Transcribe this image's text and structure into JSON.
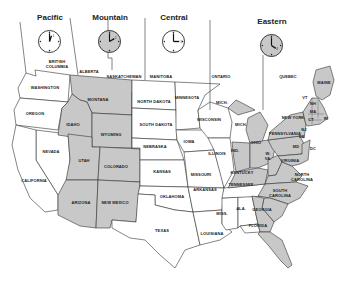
{
  "zones": [
    {
      "id": "pacific",
      "label": "Pacific",
      "hour_numeral": "1",
      "shaded": false
    },
    {
      "id": "mountain",
      "label": "Mountain",
      "hour_numeral": "2",
      "shaded": true
    },
    {
      "id": "central",
      "label": "Central",
      "hour_numeral": "3",
      "shaded": false
    },
    {
      "id": "eastern",
      "label": "Eastern",
      "hour_numeral": "4",
      "shaded": true
    }
  ],
  "colors": {
    "shaded": "#c8c8c8",
    "unshaded": "#ffffff",
    "border": "#333333",
    "text": "#222222"
  },
  "regions": {
    "canada": [
      "BRITISH COLUMBIA",
      "ALBERTA",
      "SASKATCHEWAN",
      "MANITOBA",
      "ONTARIO",
      "QUEBEC"
    ],
    "pacific": [
      "WASHINGTON",
      "OREGON",
      "NEVADA",
      "CALIFORNIA"
    ],
    "mountain": [
      "MONTANA",
      "IDAHO",
      "WYOMING",
      "UTAH",
      "COLORADO",
      "ARIZONA",
      "NEW MEXICO"
    ],
    "central": [
      "NORTH DAKOTA",
      "SOUTH DAKOTA",
      "NEBRASKA",
      "KANSAS",
      "OKLAHOMA",
      "TEXAS",
      "MINNESOTA",
      "IOWA",
      "MISSOURI",
      "ARKANSAS",
      "LOUISIANA",
      "WISCONSIN",
      "ILLINOIS",
      "MISS.",
      "ALA.",
      "TENNESSEE",
      "KENTUCKY"
    ],
    "eastern": [
      "MICH.",
      "IND.",
      "OHIO",
      "KENTUCKY",
      "W. VA.",
      "VIRGINIA",
      "PENNSYLVANIA",
      "NEW YORK",
      "NORTH CAROLINA",
      "SOUTH CAROLINA",
      "GEORGIA",
      "FLORIDA",
      "MAINE",
      "VT",
      "NH",
      "MA",
      "RI",
      "CT",
      "NJ",
      "DE",
      "MD",
      "DC"
    ]
  },
  "labels": {
    "bc1": "BRITISH",
    "bc2": "COLUMBIA",
    "alberta": "ALBERTA",
    "sask": "SASKATCHEWAN",
    "manitoba": "MANITOBA",
    "ontario": "ONTARIO",
    "quebec": "QUEBEC",
    "wa": "WASHINGTON",
    "or": "OREGON",
    "nv": "NEVADA",
    "ca": "CALIFORNIA",
    "mt": "MONTANA",
    "id": "IDAHO",
    "wy": "WYOMING",
    "ut": "UTAH",
    "co": "COLORADO",
    "az": "ARIZONA",
    "nm": "NEW MEXICO",
    "nd": "NORTH DAKOTA",
    "sd": "SOUTH DAKOTA",
    "ne": "NEBRASKA",
    "ks": "KANSAS",
    "ok": "OKLAHOMA",
    "tx": "TEXAS",
    "mn": "MINNESOTA",
    "ia": "IOWA",
    "mo": "MISSOURI",
    "ar": "ARKANSAS",
    "la": "LOUISIANA",
    "wi": "WISCONSIN",
    "il": "ILLINOIS",
    "ms": "MISS.",
    "al": "ALA.",
    "tn": "TENNESSEE",
    "ky": "KENTUCKY",
    "mi_up": "MICH.",
    "mi": "MICH.",
    "in": "IND.",
    "oh": "OHIO",
    "wv1": "W.",
    "wv2": "VA.",
    "va": "VIRGINIA",
    "pa": "PENNSYLVANIA",
    "ny": "NEW YORK",
    "nc1": "NORTH",
    "nc2": "CAROLINA",
    "sc1": "SOUTH",
    "sc2": "CAROLINA",
    "ga": "GEORGIA",
    "fl": "FLORIDA",
    "me": "MAINE",
    "vt": "VT",
    "nh": "NH",
    "ma": "MA",
    "ri": "RI",
    "ct": "CT",
    "nj": "NJ",
    "de": "DE",
    "md": "MD",
    "dc": "DC"
  }
}
